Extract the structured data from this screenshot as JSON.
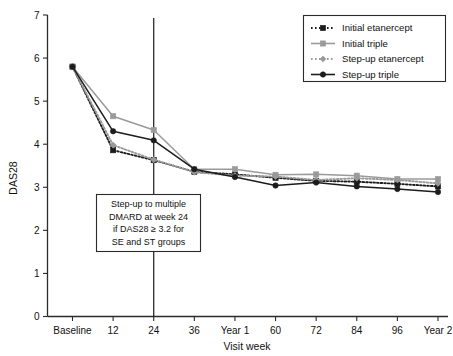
{
  "chart_data": {
    "type": "line",
    "title": "",
    "xlabel": "Visit week",
    "ylabel": "DAS28",
    "categories": [
      "Baseline",
      "12",
      "24",
      "36",
      "Year 1",
      "60",
      "72",
      "84",
      "96",
      "Year 2"
    ],
    "xtick_labels": [
      "Baseline",
      "12",
      "24",
      "36",
      "Year 1",
      "60",
      "72",
      "84",
      "96",
      "Year 2"
    ],
    "ytick_labels": [
      "0",
      "1",
      "2",
      "3",
      "4",
      "5",
      "6",
      "7"
    ],
    "ylim": [
      0,
      7
    ],
    "grid": false,
    "legend_position": "top-right",
    "series": [
      {
        "name": "Initial etanercept",
        "color": "#1c1c1c",
        "linestyle": "dotted",
        "marker": "square",
        "values": [
          5.8,
          3.86,
          3.63,
          3.36,
          3.3,
          3.22,
          3.15,
          3.13,
          3.08,
          3.02
        ]
      },
      {
        "name": "Initial triple",
        "color": "#9a9a9a",
        "linestyle": "solid",
        "marker": "square",
        "values": [
          5.8,
          4.65,
          4.33,
          3.42,
          3.42,
          3.29,
          3.3,
          3.27,
          3.19,
          3.19
        ]
      },
      {
        "name": "Step-up etanercept",
        "color": "#9a9a9a",
        "linestyle": "dotted",
        "marker": "diamond",
        "values": [
          5.8,
          3.98,
          3.64,
          3.35,
          3.27,
          3.25,
          3.17,
          3.21,
          3.17,
          3.09
        ]
      },
      {
        "name": "Step-up triple",
        "color": "#1c1c1c",
        "linestyle": "solid",
        "marker": "circle",
        "values": [
          5.8,
          4.3,
          4.09,
          3.42,
          3.24,
          3.04,
          3.11,
          3.02,
          2.96,
          2.89
        ]
      }
    ],
    "annotation": {
      "lines": [
        "Step-up to multiple",
        "DMARD at week 24",
        "if DAS28 ≥ 3.2 for",
        "SE and ST groups"
      ],
      "vertical_marker_category": "24"
    }
  }
}
